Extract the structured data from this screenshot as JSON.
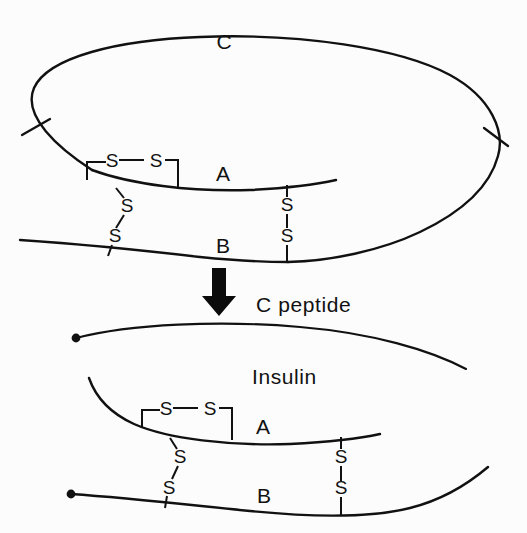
{
  "figure": {
    "title_visible": false,
    "background_color": "#fcfcfc",
    "ink_color": "#111111",
    "panels": [
      {
        "id": "proinsulin",
        "description": "Proinsulin: single looped chain with C connecting peptide joining A and B chains",
        "labels": {
          "c_label": "C",
          "a_label": "A",
          "b_label": "B"
        }
      },
      {
        "id": "products",
        "description": "Cleavage products: free C peptide and insulin (A and B chains joined by disulfide bonds)",
        "labels": {
          "c_peptide_label": "C peptide",
          "insulin_label": "Insulin",
          "a_label": "A",
          "b_label": "B"
        }
      }
    ]
  },
  "sulfur_labels": {
    "intrachain_left": "S",
    "intrachain_right": "S",
    "interchain_left_upper": "S",
    "interchain_left_lower": "S",
    "interchain_right_upper": "S",
    "interchain_right_lower": "S"
  },
  "top_panel": {
    "c_label": "C",
    "a_label": "A",
    "b_label": "B",
    "intrachain_s_left": "S",
    "intrachain_s_right": "S",
    "bond1_s_upper": "S",
    "bond1_s_lower": "S",
    "bond2_s_upper": "S",
    "bond2_s_lower": "S"
  },
  "bottom_panel": {
    "c_peptide_label": "C peptide",
    "insulin_label": "Insulin",
    "a_label": "A",
    "b_label": "B",
    "intrachain_s_left": "S",
    "intrachain_s_right": "S",
    "bond1_s_upper": "S",
    "bond1_s_lower": "S",
    "bond2_s_upper": "S",
    "bond2_s_lower": "S"
  },
  "arrow": {
    "name": "conversion-arrow",
    "direction": "down"
  }
}
